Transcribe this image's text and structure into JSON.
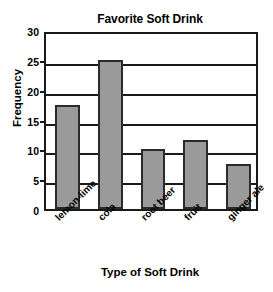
{
  "chart_data": {
    "type": "bar",
    "title": "Favorite Soft Drink",
    "xlabel": "Type of Soft Drink",
    "ylabel": "Frequency",
    "categories": [
      "lemon-lime",
      "cola",
      "root beer",
      "fruit",
      "ginger ale"
    ],
    "values": [
      17.5,
      25,
      10,
      11.5,
      7.5
    ],
    "ylim": [
      0,
      30
    ],
    "yticks": [
      0,
      5,
      10,
      15,
      20,
      25,
      30
    ],
    "ytick_labels": [
      "0",
      "5",
      "10",
      "15",
      "20",
      "25",
      "30"
    ],
    "grid": true,
    "grid_axis": "y",
    "legend": false,
    "legend_position": "none",
    "bar_color": "#9a9a9a",
    "bar_edge_color": "#2b2b2b",
    "axis_color": "#1a1a1a",
    "background_color": "#ffffff",
    "xtick_rotation": 45,
    "series": [
      {
        "name": "Frequency",
        "values": [
          17.5,
          25,
          10,
          11.5,
          7.5
        ]
      }
    ]
  }
}
